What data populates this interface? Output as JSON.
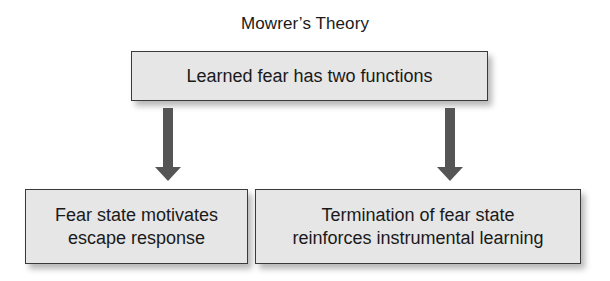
{
  "diagram": {
    "title": "Mowrer’s Theory",
    "root": {
      "label": "Learned fear has two functions"
    },
    "children": [
      {
        "line1": "Fear state motivates",
        "line2": "escape response"
      },
      {
        "line1": "Termination of fear state",
        "line2": "reinforces instrumental learning"
      }
    ],
    "colors": {
      "box_fill": "#e6e6e6",
      "box_border": "#3a3a3a",
      "arrow": "#555555",
      "text": "#1a1a1a"
    }
  }
}
